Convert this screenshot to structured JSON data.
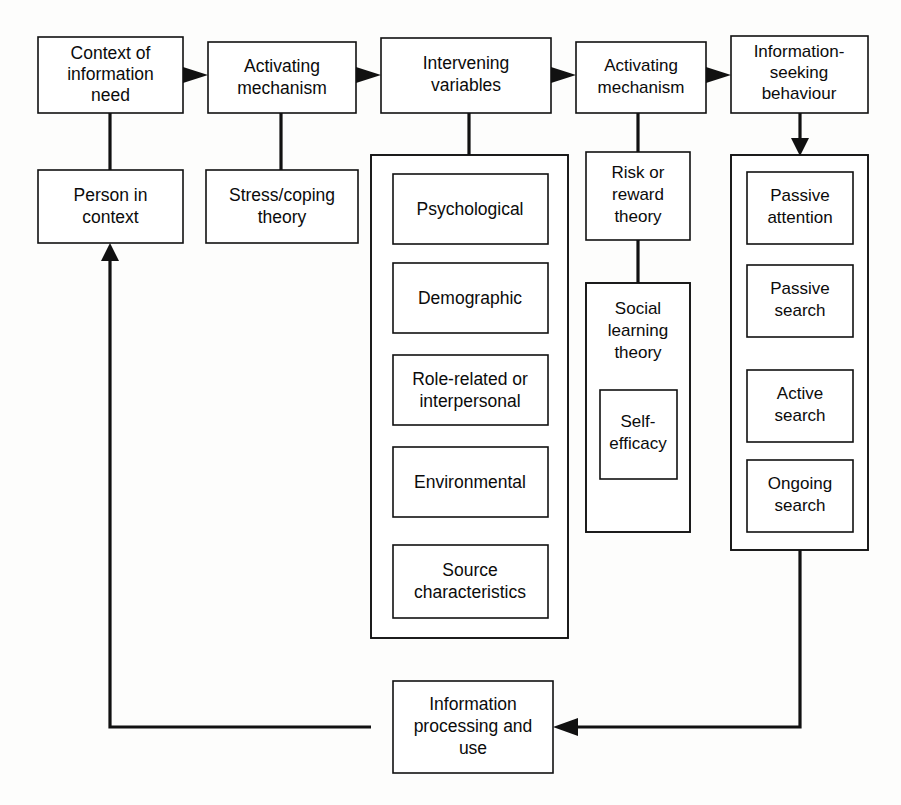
{
  "diagram": {
    "background_color": "#fdfdfc",
    "line_color": "#111111",
    "box_fill": "#ffffff",
    "top_row": [
      {
        "id": "context-of-information-need",
        "lines": [
          "Context of",
          "information",
          "need"
        ]
      },
      {
        "id": "activating-mechanism-1",
        "lines": [
          "Activating",
          "mechanism"
        ]
      },
      {
        "id": "intervening-variables",
        "lines": [
          "Intervening",
          "variables"
        ]
      },
      {
        "id": "activating-mechanism-2",
        "lines": [
          "Activating",
          "mechanism"
        ]
      },
      {
        "id": "information-seeking-behaviour",
        "lines": [
          "Information-",
          "seeking",
          "behaviour"
        ]
      }
    ],
    "second_row": [
      {
        "id": "person-in-context",
        "lines": [
          "Person in",
          "context"
        ]
      },
      {
        "id": "stress-coping-theory",
        "lines": [
          "Stress/coping",
          "theory"
        ]
      }
    ],
    "intervening_variables_items": [
      {
        "id": "psychological",
        "lines": [
          "Psychological"
        ]
      },
      {
        "id": "demographic",
        "lines": [
          "Demographic"
        ]
      },
      {
        "id": "role-related-or-interpersonal",
        "lines": [
          "Role-related or",
          "interpersonal"
        ]
      },
      {
        "id": "environmental",
        "lines": [
          "Environmental"
        ]
      },
      {
        "id": "source-characteristics",
        "lines": [
          "Source",
          "characteristics"
        ]
      }
    ],
    "risk_reward_column": [
      {
        "id": "risk-or-reward-theory",
        "lines": [
          "Risk or",
          "reward",
          "theory"
        ]
      },
      {
        "id": "social-learning-theory",
        "lines": [
          "Social",
          "learning",
          "theory"
        ]
      }
    ],
    "social_learning_child": {
      "id": "self-efficacy",
      "lines": [
        "Self-",
        "efficacy"
      ]
    },
    "information_seeking_items": [
      {
        "id": "passive-attention",
        "lines": [
          "Passive",
          "attention"
        ]
      },
      {
        "id": "passive-search",
        "lines": [
          "Passive",
          "search"
        ]
      },
      {
        "id": "active-search",
        "lines": [
          "Active",
          "search"
        ]
      },
      {
        "id": "ongoing-search",
        "lines": [
          "Ongoing",
          "search"
        ]
      }
    ],
    "feedback_box": {
      "id": "information-processing-and-use",
      "lines": [
        "Information",
        "processing and",
        "use"
      ]
    }
  }
}
